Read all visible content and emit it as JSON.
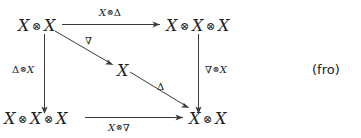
{
  "figure": {
    "kind": "commutative-diagram",
    "tag": "(fro)",
    "tensor_symbol": "⊗",
    "nodes": {
      "top_left": {
        "label": "X ⊗ X",
        "parts": [
          "X",
          "X"
        ]
      },
      "top_right": {
        "label": "X ⊗ X ⊗ X",
        "parts": [
          "X",
          "X",
          "X"
        ]
      },
      "center": {
        "label": "X",
        "parts": [
          "X"
        ]
      },
      "bottom_left": {
        "label": "X ⊗ X ⊗ X",
        "parts": [
          "X",
          "X",
          "X"
        ]
      },
      "bottom_right": {
        "label": "X ⊗ X",
        "parts": [
          "X",
          "X"
        ]
      }
    },
    "edges": {
      "top": {
        "label": "X⊗Δ",
        "left": "X",
        "op": "Δ",
        "from": "top_left",
        "to": "top_right",
        "direction": "right"
      },
      "left": {
        "label": "Δ⊗X",
        "left": "Δ",
        "op": "X",
        "from": "top_left",
        "to": "bottom_left",
        "direction": "down"
      },
      "right": {
        "label": "∇⊗X",
        "left": "∇",
        "op": "X",
        "from": "top_right",
        "to": "bottom_right",
        "direction": "down"
      },
      "bottom": {
        "label": "X⊗∇",
        "left": "X",
        "op": "∇",
        "from": "bottom_left",
        "to": "bottom_right",
        "direction": "right"
      },
      "diagonal_upper": {
        "label": "∇",
        "from": "top_left",
        "to": "center",
        "direction": "down-right"
      },
      "diagonal_lower": {
        "label": "Δ",
        "from": "center",
        "to": "bottom_right",
        "direction": "down-right"
      }
    }
  },
  "symbols": {
    "nabla": "∇",
    "delta": "Δ",
    "tensor": "⊗",
    "X": "X"
  }
}
